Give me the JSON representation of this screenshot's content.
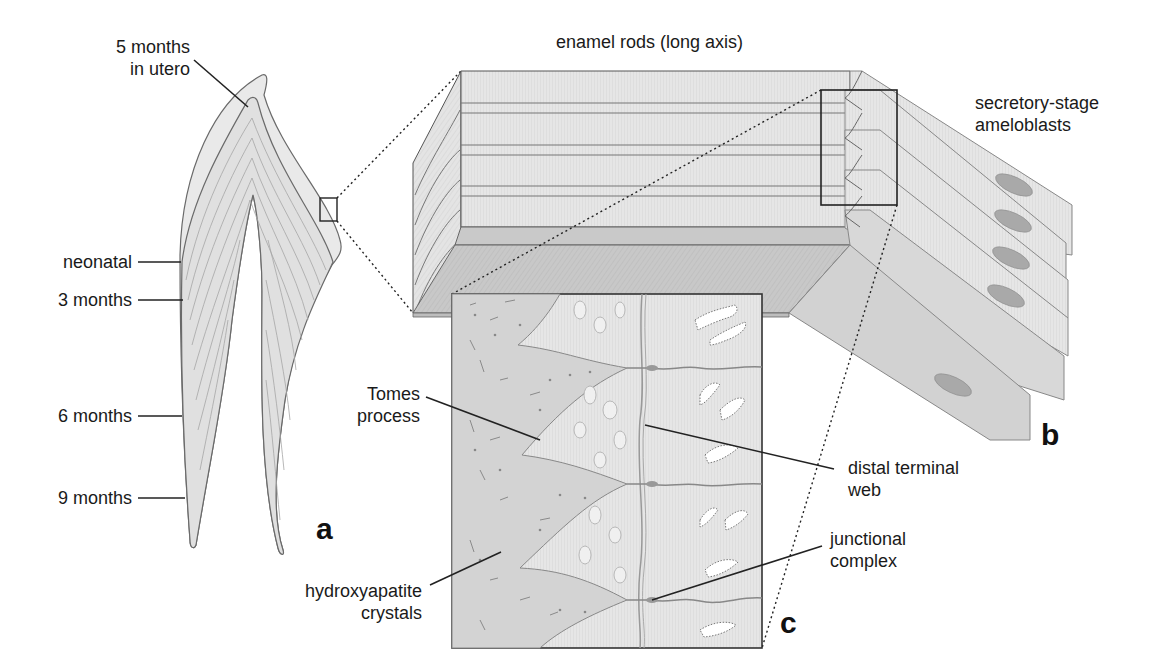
{
  "figure": {
    "title_top": "enamel rods (long axis)",
    "panels": {
      "a": "a",
      "b": "b",
      "c": "c"
    },
    "panel_a_labels": {
      "in_utero_line1": "5 months",
      "in_utero_line2": "in utero",
      "neonatal": "neonatal",
      "three_months": "3 months",
      "six_months": "6 months",
      "nine_months": "9 months"
    },
    "panel_b_labels": {
      "ameloblasts_line1": "secretory-stage",
      "ameloblasts_line2": "ameloblasts"
    },
    "panel_c_labels": {
      "tomes_line1": "Tomes",
      "tomes_line2": "process",
      "hydroxy_line1": "hydroxyapatite",
      "hydroxy_line2": "crystals",
      "distal_line1": "distal terminal",
      "distal_line2": "web",
      "junctional_line1": "junctional",
      "junctional_line2": "complex"
    },
    "colors": {
      "fill_light": "#e8e8e8",
      "fill_mid": "#d2d2d2",
      "fill_dark": "#bdbdbd",
      "stroke": "#555555",
      "ink": "#1a1a1a",
      "nucleus": "#a9a9a9"
    }
  }
}
